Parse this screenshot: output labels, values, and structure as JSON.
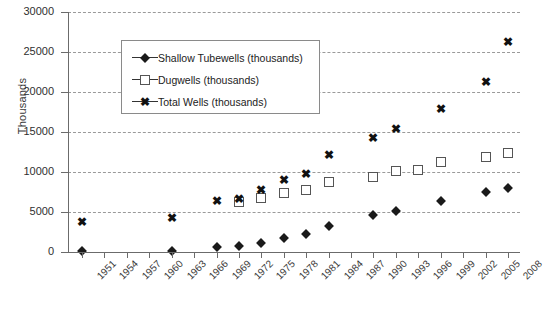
{
  "chart_data": {
    "type": "scatter",
    "title": "",
    "xlabel": "",
    "ylabel": "Thousands",
    "ylim": [
      0,
      30000
    ],
    "ytick_labels": [
      "0",
      "5000",
      "10000",
      "15000",
      "20000",
      "25000",
      "30000"
    ],
    "ytick_values": [
      0,
      5000,
      10000,
      15000,
      20000,
      25000,
      30000
    ],
    "grid": true,
    "legend_position": "upper-left-inside",
    "categories": [
      "1951",
      "1954",
      "1957",
      "1960",
      "1963",
      "1966",
      "1969",
      "1972",
      "1975",
      "1978",
      "1981",
      "1984",
      "1987",
      "1990",
      "1993",
      "1996",
      "1999",
      "2002",
      "2005",
      "2008"
    ],
    "series": [
      {
        "name": "Shallow Tubewells (thousands)",
        "marker": "diamond",
        "points": [
          {
            "x": "1951",
            "y": 80
          },
          {
            "x": "1963",
            "y": 100
          },
          {
            "x": "1969",
            "y": 600
          },
          {
            "x": "1972",
            "y": 800
          },
          {
            "x": "1975",
            "y": 1100
          },
          {
            "x": "1978",
            "y": 1800
          },
          {
            "x": "1981",
            "y": 2200
          },
          {
            "x": "1984",
            "y": 3300
          },
          {
            "x": "1990",
            "y": 4600
          },
          {
            "x": "1993",
            "y": 5100
          },
          {
            "x": "1999",
            "y": 6400
          },
          {
            "x": "2005",
            "y": 7500
          },
          {
            "x": "2008",
            "y": 7950
          }
        ]
      },
      {
        "name": "Dugwells (thousands)",
        "marker": "square",
        "points": [
          {
            "x": "1972",
            "y": 6200
          },
          {
            "x": "1975",
            "y": 6700
          },
          {
            "x": "1978",
            "y": 7400
          },
          {
            "x": "1981",
            "y": 7700
          },
          {
            "x": "1984",
            "y": 8700
          },
          {
            "x": "1990",
            "y": 9400
          },
          {
            "x": "1993",
            "y": 10100
          },
          {
            "x": "1996",
            "y": 10300
          },
          {
            "x": "1999",
            "y": 11200
          },
          {
            "x": "2005",
            "y": 11900
          },
          {
            "x": "2008",
            "y": 12400
          }
        ]
      },
      {
        "name": "Total Wells (thousands)",
        "marker": "cross",
        "points": [
          {
            "x": "1951",
            "y": 3800
          },
          {
            "x": "1963",
            "y": 4200
          },
          {
            "x": "1969",
            "y": 6400
          },
          {
            "x": "1972",
            "y": 6600
          },
          {
            "x": "1975",
            "y": 7800
          },
          {
            "x": "1978",
            "y": 9000
          },
          {
            "x": "1981",
            "y": 9800
          },
          {
            "x": "1984",
            "y": 12100
          },
          {
            "x": "1990",
            "y": 14200
          },
          {
            "x": "1993",
            "y": 15400
          },
          {
            "x": "1999",
            "y": 17900
          },
          {
            "x": "2005",
            "y": 21300
          },
          {
            "x": "2008",
            "y": 26300
          }
        ]
      }
    ]
  },
  "legend": {
    "items": [
      {
        "label": "Shallow Tubewells (thousands)",
        "marker": "diamond"
      },
      {
        "label": "Dugwells (thousands)",
        "marker": "square"
      },
      {
        "label": "Total Wells (thousands)",
        "marker": "cross"
      }
    ]
  },
  "caption": {
    "text": ""
  }
}
